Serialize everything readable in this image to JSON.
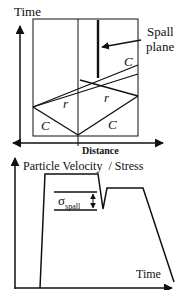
{
  "top_diagram": {
    "y_axis_label": "Time",
    "x_axis_label": "Distance",
    "annotation": {
      "line1": "Spall",
      "line2": "plane"
    },
    "region_labels": {
      "compression_upper_right": "C",
      "rarefaction_left": "r",
      "rarefaction_right": "r",
      "compression_lower_left": "C",
      "compression_lower_right": "C"
    }
  },
  "bottom_graph": {
    "title": "Particle Velocity  / Stress",
    "x_axis_label": "Time",
    "spall_symbol": "σ",
    "spall_subscript": "spall"
  },
  "colors": {
    "line": "#111111",
    "background": "#ffffff"
  }
}
